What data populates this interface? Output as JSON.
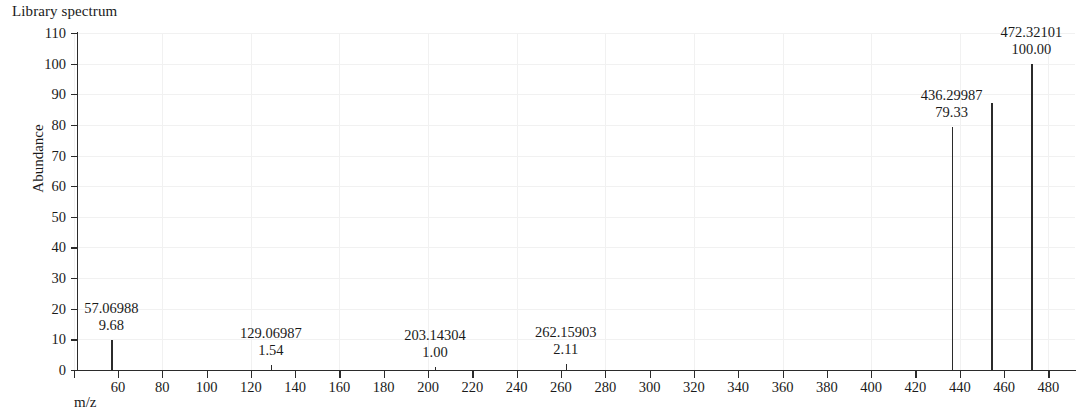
{
  "title": "Library spectrum",
  "axes": {
    "x_label": "m/z",
    "y_label": "Abundance",
    "y_ticks": [
      "0",
      "10",
      "20",
      "30",
      "40",
      "50",
      "60",
      "70",
      "80",
      "90",
      "100",
      "110"
    ],
    "x_ticks": [
      "60",
      "80",
      "100",
      "120",
      "140",
      "160",
      "180",
      "200",
      "220",
      "240",
      "260",
      "280",
      "300",
      "320",
      "340",
      "360",
      "380",
      "400",
      "420",
      "440",
      "460",
      "480"
    ]
  },
  "colors": {
    "ink": "#2b2b2b",
    "grid": "#f1f1f1",
    "background": "#ffffff"
  },
  "chart_data": {
    "type": "bar",
    "title": "Library spectrum",
    "xlabel": "m/z",
    "ylabel": "Abundance",
    "xlim": [
      42,
      492
    ],
    "ylim": [
      0,
      110
    ],
    "grid": true,
    "legend": null,
    "x": [
      57.06988,
      129.06987,
      203.14304,
      262.15903,
      436.29987,
      454.31,
      472.32101
    ],
    "values": [
      9.68,
      1.54,
      1.0,
      2.11,
      79.33,
      87.0,
      100.0
    ],
    "labels": [
      {
        "mz": "57.06988",
        "intensity": "9.68"
      },
      {
        "mz": "129.06987",
        "intensity": "1.54"
      },
      {
        "mz": "203.14304",
        "intensity": "1.00"
      },
      {
        "mz": "262.15903",
        "intensity": "2.11"
      },
      {
        "mz": "436.29987",
        "intensity": "79.33"
      },
      {
        "mz": "",
        "intensity": ""
      },
      {
        "mz": "472.32101",
        "intensity": "100.00"
      }
    ]
  },
  "peaks": [
    {
      "id": "peak-57",
      "mz_label": "57.06988",
      "intensity_label": "9.68",
      "mz": 57.06988,
      "intensity": 9.68
    },
    {
      "id": "peak-129",
      "mz_label": "129.06987",
      "intensity_label": "1.54",
      "mz": 129.06987,
      "intensity": 1.54
    },
    {
      "id": "peak-203",
      "mz_label": "203.14304",
      "intensity_label": "1.00",
      "mz": 203.14304,
      "intensity": 1.0
    },
    {
      "id": "peak-262",
      "mz_label": "262.15903",
      "intensity_label": "2.11",
      "mz": 262.15903,
      "intensity": 2.11
    },
    {
      "id": "peak-436",
      "mz_label": "436.29987",
      "intensity_label": "79.33",
      "mz": 436.29987,
      "intensity": 79.33
    },
    {
      "id": "peak-454",
      "mz_label": "",
      "intensity_label": "",
      "mz": 454.31,
      "intensity": 87.0
    },
    {
      "id": "peak-472",
      "mz_label": "472.32101",
      "intensity_label": "100.00",
      "mz": 472.32101,
      "intensity": 100.0
    }
  ]
}
